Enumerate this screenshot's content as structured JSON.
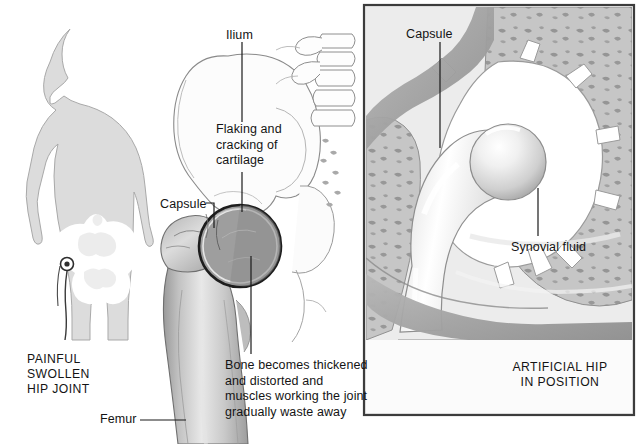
{
  "figure": {
    "type": "medical-illustration",
    "background_color": "#ffffff"
  },
  "left_panel": {
    "name": "body-silhouette-with-affected-hip",
    "caption_lines": [
      "PAINFUL",
      "SWOLLEN",
      "HIP JOINT"
    ],
    "caption": "PAINFUL\nSWOLLEN\nHIP JOINT",
    "silhouette_color": "#dcdcdc",
    "pelvis_color": "#ffffff",
    "marker_color": "#3a3a3a"
  },
  "center_panel": {
    "name": "diseased-hip-joint-illustration",
    "labels": [
      {
        "id": "ilium",
        "text": "Ilium",
        "lines": [
          "Ilium"
        ],
        "x": 226,
        "y": 28
      },
      {
        "id": "flaking-cracking-cartilage",
        "text": "Flaking and\ncracking of\ncartilage",
        "lines": [
          "Flaking and",
          "cracking of",
          "cartilage"
        ],
        "x": 216,
        "y": 122
      },
      {
        "id": "capsule",
        "text": "Capsule",
        "lines": [
          "Capsule"
        ],
        "x": 160,
        "y": 197
      },
      {
        "id": "bone-thickened",
        "text": "Bone becomes thickened\nand distorted and\nmuscles working the joint\ngradually waste away",
        "lines": [
          "Bone becomes thickened",
          "and distorted and",
          "muscles working the joint",
          "gradually waste away"
        ],
        "x": 225,
        "y": 358
      },
      {
        "id": "femur",
        "text": "Femur",
        "lines": [
          "Femur"
        ],
        "x": 100,
        "y": 412
      }
    ],
    "bone_color": "#b4b4b4",
    "capsule_outline_color": "#1d1d1d",
    "pelvis_outline_color": "#777777"
  },
  "right_panel": {
    "name": "artificial-hip-panel",
    "caption_lines": [
      "ARTIFICIAL HIP",
      "IN POSITION"
    ],
    "caption": "ARTIFICIAL HIP\nIN POSITION",
    "border_color": "#3c3c3c",
    "background_color": "#ececec",
    "labels": [
      {
        "id": "capsule-prosthetic",
        "text": "Capsule",
        "lines": [
          "Capsule"
        ],
        "x": 406,
        "y": 27
      },
      {
        "id": "synovial-fluid",
        "text": "Synovial fluid",
        "lines": [
          "Synovial fluid"
        ],
        "x": 511,
        "y": 240
      }
    ],
    "prosthesis_color": "#ffffff",
    "trabecular_bone_color": "#c0c0c0"
  }
}
